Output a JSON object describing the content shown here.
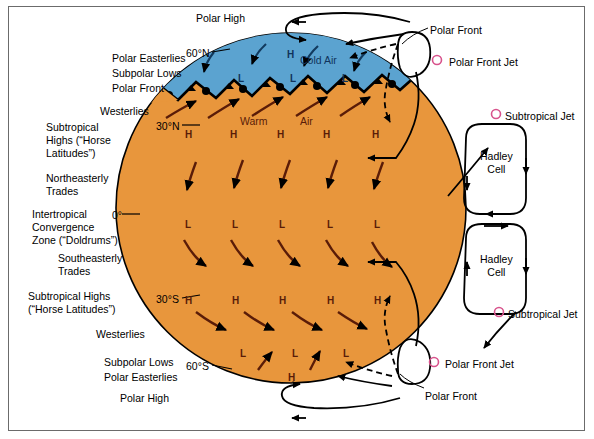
{
  "figure": {
    "globe": {
      "surface_color": "#E8963C",
      "cold_air_color": "#5BA3D0",
      "outline_color": "#000000",
      "center_x": 291,
      "center_y": 208,
      "radius": 175
    },
    "accent_jet_color": "#D8538C",
    "arrow_color": "#5A1C08"
  },
  "left_labels": [
    {
      "text": "Polar Easterlies",
      "x": 112,
      "y": 52
    },
    {
      "text": "Subpolar Lows",
      "x": 112,
      "y": 67
    },
    {
      "text": "Polar Front",
      "x": 112,
      "y": 82
    },
    {
      "text": "Westerlies",
      "x": 100,
      "y": 105
    },
    {
      "text": "Subtropical",
      "x": 46,
      "y": 121
    },
    {
      "text": "Highs (“Horse",
      "x": 46,
      "y": 134
    },
    {
      "text": "Latitudes”)",
      "x": 46,
      "y": 147
    },
    {
      "text": "Northeasterly",
      "x": 46,
      "y": 172
    },
    {
      "text": "Trades",
      "x": 46,
      "y": 185
    },
    {
      "text": "Intertropical",
      "x": 32,
      "y": 208
    },
    {
      "text": "Convergence",
      "x": 32,
      "y": 221
    },
    {
      "text": "Zone (“Doldrums”)",
      "x": 32,
      "y": 234
    },
    {
      "text": "Southeasterly",
      "x": 58,
      "y": 252
    },
    {
      "text": "Trades",
      "x": 58,
      "y": 265
    },
    {
      "text": "Subtropical Highs",
      "x": 28,
      "y": 290
    },
    {
      "text": "(“Horse Latitudes”)",
      "x": 28,
      "y": 303
    },
    {
      "text": "Westerlies",
      "x": 96,
      "y": 328
    },
    {
      "text": "Subpolar Lows",
      "x": 104,
      "y": 356
    },
    {
      "text": "Polar Easterlies",
      "x": 104,
      "y": 371
    },
    {
      "text": "Polar High",
      "x": 120,
      "y": 392
    }
  ],
  "top_label": {
    "text": "Polar High",
    "x": 196,
    "y": 12
  },
  "latitudes": [
    {
      "text": "60°N",
      "x": 186,
      "y": 47
    },
    {
      "text": "30°N",
      "x": 156,
      "y": 120
    },
    {
      "text": "0°",
      "x": 112,
      "y": 209
    },
    {
      "text": "30°S",
      "x": 156,
      "y": 293
    },
    {
      "text": "60°S",
      "x": 186,
      "y": 360
    }
  ],
  "globe_annotations": [
    {
      "text": "Cold Air",
      "x": 300,
      "y": 54,
      "style": "dark"
    },
    {
      "text": "Warm",
      "x": 240,
      "y": 115,
      "style": "brown"
    },
    {
      "text": "Air",
      "x": 300,
      "y": 115,
      "style": "brown"
    }
  ],
  "pressure_symbols": {
    "north_polar_high": [
      {
        "label": "H",
        "x": 287,
        "y": 49
      }
    ],
    "subpolar_lows_n": [
      {
        "label": "L",
        "x": 238,
        "y": 73
      },
      {
        "label": "L",
        "x": 290,
        "y": 73
      },
      {
        "label": "L",
        "x": 342,
        "y": 73
      }
    ],
    "subtropical_highs_n": [
      {
        "label": "H",
        "x": 185,
        "y": 129
      },
      {
        "label": "H",
        "x": 230,
        "y": 129
      },
      {
        "label": "H",
        "x": 277,
        "y": 129
      },
      {
        "label": "H",
        "x": 323,
        "y": 129
      },
      {
        "label": "H",
        "x": 372,
        "y": 129
      }
    ],
    "equatorial_lows": [
      {
        "label": "L",
        "x": 185,
        "y": 219
      },
      {
        "label": "L",
        "x": 232,
        "y": 219
      },
      {
        "label": "L",
        "x": 279,
        "y": 219
      },
      {
        "label": "L",
        "x": 327,
        "y": 219
      },
      {
        "label": "L",
        "x": 374,
        "y": 219
      }
    ],
    "subtropical_highs_s": [
      {
        "label": "H",
        "x": 185,
        "y": 295
      },
      {
        "label": "H",
        "x": 232,
        "y": 295
      },
      {
        "label": "H",
        "x": 279,
        "y": 295
      },
      {
        "label": "H",
        "x": 327,
        "y": 295
      },
      {
        "label": "H",
        "x": 374,
        "y": 295
      }
    ],
    "subpolar_lows_s": [
      {
        "label": "L",
        "x": 240,
        "y": 348
      },
      {
        "label": "L",
        "x": 292,
        "y": 348
      },
      {
        "label": "L",
        "x": 343,
        "y": 348
      }
    ],
    "south_polar_high": [
      {
        "label": "H",
        "x": 288,
        "y": 372
      }
    ]
  },
  "right_labels": [
    {
      "text": "Polar Front",
      "x": 430,
      "y": 24
    },
    {
      "text": "Polar Front Jet",
      "x": 449,
      "y": 56
    },
    {
      "text": "Subtropical Jet",
      "x": 505,
      "y": 110
    },
    {
      "text": "Subtropical Jet",
      "x": 508,
      "y": 308
    },
    {
      "text": "Polar Front Jet",
      "x": 445,
      "y": 358
    },
    {
      "text": "Polar Front",
      "x": 425,
      "y": 390
    }
  ],
  "jet_markers": [
    {
      "name": "polar-front-jet-north",
      "cx": 437,
      "cy": 60,
      "r": 4.5
    },
    {
      "name": "subtropical-jet-north",
      "cx": 494,
      "cy": 114,
      "r": 4.5
    },
    {
      "name": "subtropical-jet-south",
      "cx": 497,
      "cy": 312,
      "r": 4.5
    },
    {
      "name": "polar-front-jet-south",
      "cx": 434,
      "cy": 362,
      "r": 4.5
    }
  ],
  "cells": [
    {
      "label_line1": "Hadley",
      "label_line2": "Cell",
      "x": 480,
      "y": 150
    },
    {
      "label_line1": "Hadley",
      "label_line2": "Cell",
      "x": 480,
      "y": 253
    }
  ]
}
